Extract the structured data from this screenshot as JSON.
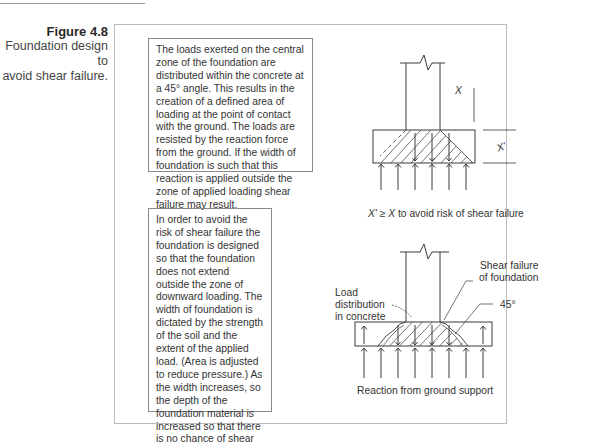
{
  "figure": {
    "number": "Figure 4.8",
    "title_line1": "Foundation design to",
    "title_line2": "avoid shear failure."
  },
  "text_boxes": [
    {
      "id": "box1",
      "text": "The loads exerted on the central zone of the foundation are distributed within the concrete at a 45° angle. This results in the creation of a defined area of loading at the point of contact with the ground. The loads are resisted by the reaction force from the ground. If the width of foundation is such that this reaction is applied outside the zone of applied loading shear failure may result."
    },
    {
      "id": "box2",
      "text": "In order to avoid the risk of shear failure the foundation is designed so that the foundation does not extend outside the zone of downward loading. The width of foundation is dictated by the strength of the soil and the extent of the applied load. (Area is adjusted to reduce pressure.) As the width increases, so the depth of the foundation material is increased so that there is no chance of shear failure."
    }
  ],
  "diagram1": {
    "label_x": "X",
    "label_x_prime": "X'",
    "caption_prefix": "X' ≥ X",
    "caption_suffix": " to avoid risk of shear failure"
  },
  "diagram2": {
    "label_load_line1": "Load",
    "label_load_line2": "distribution",
    "label_load_line3": "in concrete",
    "label_shear_line1": "Shear failure",
    "label_shear_line2": "of foundation",
    "label_angle": "45°",
    "caption": "Reaction from ground support"
  },
  "colors": {
    "line": "#3a3a3a",
    "frame": "#b9b9b9",
    "text": "#333333"
  }
}
